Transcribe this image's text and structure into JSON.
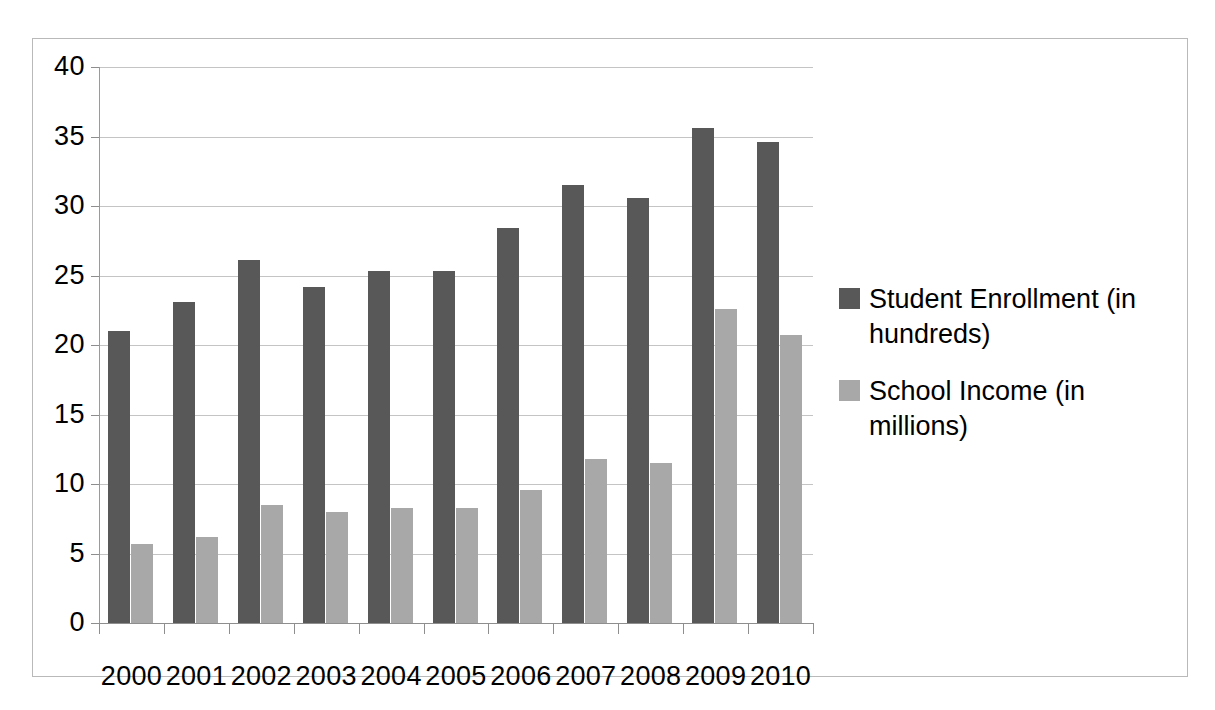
{
  "chart_data": {
    "type": "bar",
    "title": "",
    "subtitle": "",
    "xlabel": "",
    "ylabel": "",
    "categories": [
      "2000",
      "2001",
      "2002",
      "2003",
      "2004",
      "2005",
      "2006",
      "2007",
      "2008",
      "2009",
      "2010"
    ],
    "series": [
      {
        "name": "Student Enrollment (in hundreds)",
        "color": "#585858",
        "values": [
          21.0,
          23.1,
          26.1,
          24.2,
          25.3,
          25.3,
          28.4,
          31.5,
          30.6,
          35.6,
          34.6
        ]
      },
      {
        "name": "School Income (in millions)",
        "color": "#a8a8a8",
        "values": [
          5.7,
          6.2,
          8.5,
          8.0,
          8.3,
          8.3,
          9.6,
          11.8,
          11.5,
          22.6,
          20.7
        ]
      }
    ],
    "ylim": [
      0,
      40
    ],
    "y_ticks": [
      0,
      5,
      10,
      15,
      20,
      25,
      30,
      35,
      40
    ],
    "y_tick_labels": [
      "0",
      "5",
      "10",
      "15",
      "20",
      "25",
      "30",
      "35",
      "40"
    ],
    "grid": true,
    "grid_axis": "y",
    "legend": {
      "position": "right",
      "entries": [
        "Student Enrollment (in hundreds)",
        "School Income (in millions)"
      ]
    },
    "plot_background": "#ffffff",
    "border_color": "#b9b9b9",
    "gridline_color": "#c4c4c4",
    "axis_color": "#8e8e8e"
  }
}
